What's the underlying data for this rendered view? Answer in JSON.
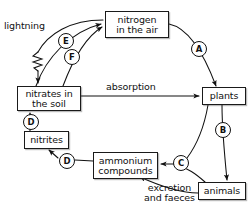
{
  "diagram": {
    "type": "cycle-flow-diagram",
    "line_color": "#1a1a1a",
    "background": "#ffffff",
    "nodes": [
      {
        "id": "nitrogen_air",
        "label_line1": "nitrogen",
        "label_line2": "in the air",
        "x": 105,
        "y": 11,
        "w": 64,
        "h": 27
      },
      {
        "id": "nitrates_soil",
        "label_line1": "nitrates in",
        "label_line2": "the soil",
        "x": 17,
        "y": 86,
        "w": 64,
        "h": 25
      },
      {
        "id": "plants",
        "label_line1": "plants",
        "label_line2": "",
        "x": 202,
        "y": 87,
        "w": 44,
        "h": 18
      },
      {
        "id": "nitrites",
        "label_line1": "nitrites",
        "label_line2": "",
        "x": 24,
        "y": 131,
        "w": 45,
        "h": 18
      },
      {
        "id": "ammonium",
        "label_line1": "ammonium",
        "label_line2": "compounds",
        "x": 93,
        "y": 152,
        "w": 65,
        "h": 27
      },
      {
        "id": "animals",
        "label_line1": "animals",
        "label_line2": "",
        "x": 198,
        "y": 182,
        "w": 48,
        "h": 18
      }
    ],
    "labels": [
      {
        "id": "lightning",
        "text": "lightning",
        "x": 4,
        "y": 21
      },
      {
        "id": "absorption",
        "text": "absorption",
        "x": 106,
        "y": 82
      },
      {
        "id": "excretion",
        "text": "excretion\nand faeces",
        "x": 144,
        "y": 183
      }
    ],
    "markers": [
      {
        "id": "marker_a",
        "letter": "A",
        "cx": 198,
        "cy": 48,
        "process": "nitrogen-fixation-into-plants"
      },
      {
        "id": "marker_b",
        "letter": "B",
        "cx": 222,
        "cy": 129,
        "process": "feeding"
      },
      {
        "id": "marker_c",
        "letter": "C",
        "cx": 180,
        "cy": 162,
        "process": "decomposition"
      },
      {
        "id": "marker_d1",
        "letter": "D",
        "cx": 30,
        "cy": 121,
        "process": "nitrification"
      },
      {
        "id": "marker_d2",
        "letter": "D",
        "cx": 66,
        "cy": 160,
        "process": "nitrification"
      },
      {
        "id": "marker_e",
        "letter": "E",
        "cx": 65,
        "cy": 40,
        "process": "denitrification"
      },
      {
        "id": "marker_f",
        "letter": "F",
        "cx": 71,
        "cy": 56,
        "process": "denitrification"
      }
    ]
  }
}
